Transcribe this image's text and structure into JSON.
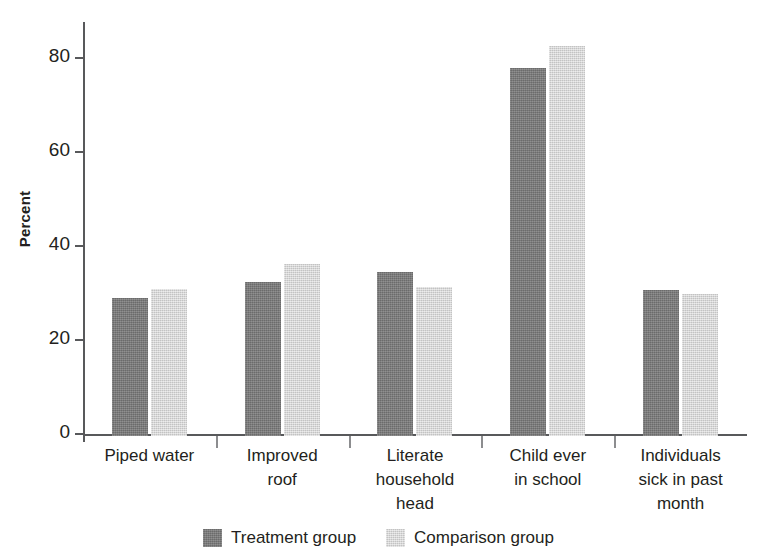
{
  "chart_data": {
    "type": "bar",
    "title": "",
    "xlabel": "",
    "ylabel": "Percent",
    "ylim": [
      0,
      88
    ],
    "yticks": [
      0,
      20,
      40,
      60,
      80
    ],
    "ytick_labels": [
      "0",
      "20",
      "40",
      "60",
      "80"
    ],
    "grid": false,
    "legend_position": "bottom-center",
    "categories": [
      "Piped water",
      "Improved roof",
      "Literate household head",
      "Child ever in school",
      "Individuals sick in past month"
    ],
    "category_label_lines": [
      [
        "Piped water"
      ],
      [
        "Improved",
        "roof"
      ],
      [
        "Literate",
        "household",
        "head"
      ],
      [
        "Child ever",
        "in school"
      ],
      [
        "Individuals",
        "sick in past",
        "month"
      ]
    ],
    "series": [
      {
        "name": "Treatment group",
        "color": "#787878",
        "values": [
          29.4,
          32.7,
          34.8,
          78.2,
          31.0
        ]
      },
      {
        "name": "Comparison group",
        "color": "#d6d6d6",
        "values": [
          31.2,
          36.6,
          31.7,
          82.8,
          30.2
        ]
      }
    ]
  },
  "legend": {
    "items": [
      {
        "label": "Treatment group",
        "color": "#787878"
      },
      {
        "label": "Comparison group",
        "color": "#d6d6d6"
      }
    ]
  }
}
